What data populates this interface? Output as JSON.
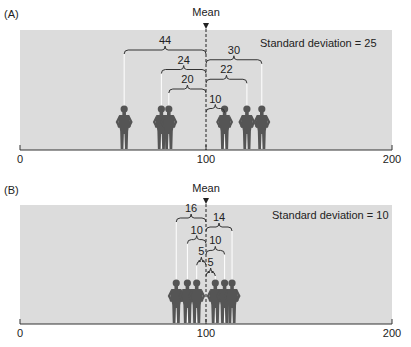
{
  "panels": [
    {
      "id": "A",
      "label": "(A)",
      "mean_label": "Mean",
      "sd_label": "Standard deviation = 25",
      "axis": {
        "min": 0,
        "max": 200,
        "ticks": [
          "0",
          "100",
          "200"
        ]
      },
      "mean": 100,
      "people": [
        56,
        76,
        80,
        110,
        122,
        130
      ],
      "braces": [
        {
          "from": 56,
          "to": 100,
          "label": "44",
          "level": 0
        },
        {
          "from": 100,
          "to": 130,
          "label": "30",
          "level": 0.5
        },
        {
          "from": 76,
          "to": 100,
          "label": "24",
          "level": 1
        },
        {
          "from": 100,
          "to": 122,
          "label": "22",
          "level": 1.5
        },
        {
          "from": 80,
          "to": 100,
          "label": "20",
          "level": 2
        },
        {
          "from": 100,
          "to": 110,
          "label": "10",
          "level": 3
        }
      ]
    },
    {
      "id": "B",
      "label": "(B)",
      "mean_label": "Mean",
      "sd_label": "Standard deviation = 10",
      "axis": {
        "min": 0,
        "max": 200,
        "ticks": [
          "0",
          "100",
          "200"
        ]
      },
      "mean": 100,
      "people": [
        84,
        90,
        95,
        105,
        110,
        114
      ],
      "braces": [
        {
          "from": 84,
          "to": 100,
          "label": "16",
          "level": 0
        },
        {
          "from": 100,
          "to": 114,
          "label": "14",
          "level": 0.5
        },
        {
          "from": 90,
          "to": 100,
          "label": "10",
          "level": 1.2
        },
        {
          "from": 100,
          "to": 110,
          "label": "10",
          "level": 1.8
        },
        {
          "from": 95,
          "to": 100,
          "label": "5",
          "level": 2.4
        },
        {
          "from": 100,
          "to": 105,
          "label": "5",
          "level": 3
        }
      ]
    }
  ],
  "colors": {
    "panel_bg": "#dcdcdc",
    "person": "#555555",
    "line": "#ffffff",
    "axis": "#333333"
  }
}
